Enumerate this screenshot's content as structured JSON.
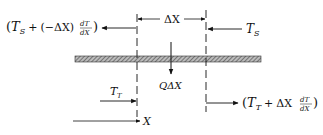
{
  "diagram": {
    "type": "heat-balance-element",
    "labels": {
      "top_left_flux": "(T_S + (−ΔX) dT_S/dX)",
      "top_right_flux": "T_S",
      "delta_x": "ΔX",
      "heat_source": "QΔX",
      "bottom_left_flux": "T_T",
      "bottom_right_flux": "(T_T + ΔX dT_T/dX)",
      "axis": "X"
    },
    "text": {
      "paren_open": "(",
      "paren_close": ")",
      "T": "T",
      "sub_S": "S",
      "sub_T": "T",
      "plus": "+",
      "neg_dx": "(−ΔX)",
      "dx": "ΔX",
      "dT": "dT",
      "dX": "dX",
      "Q": "Q",
      "X": "X"
    },
    "colors": {
      "stroke": "#111111",
      "hatch": "#555555",
      "background": "#ffffff"
    }
  }
}
